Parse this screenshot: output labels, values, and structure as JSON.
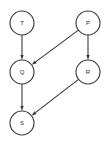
{
  "diagram": {
    "type": "directed-graph",
    "background_color": "#ffffff",
    "stroke_color": "#3a3a3a",
    "label_color": "#2b2b2b",
    "node_radius": 12,
    "nodes": [
      {
        "id": "T",
        "label": "T",
        "cx": 22,
        "cy": 23
      },
      {
        "id": "P",
        "label": "P",
        "cx": 88,
        "cy": 23
      },
      {
        "id": "Q",
        "label": "Q",
        "cx": 22,
        "cy": 72
      },
      {
        "id": "R",
        "label": "R",
        "cx": 88,
        "cy": 72
      },
      {
        "id": "S",
        "label": "S",
        "cx": 22,
        "cy": 123
      }
    ],
    "edges": [
      {
        "from": "T",
        "to": "Q",
        "directed": true
      },
      {
        "from": "P",
        "to": "Q",
        "directed": true
      },
      {
        "from": "P",
        "to": "R",
        "directed": true
      },
      {
        "from": "Q",
        "to": "S",
        "directed": true
      },
      {
        "from": "R",
        "to": "S",
        "directed": true
      }
    ]
  }
}
